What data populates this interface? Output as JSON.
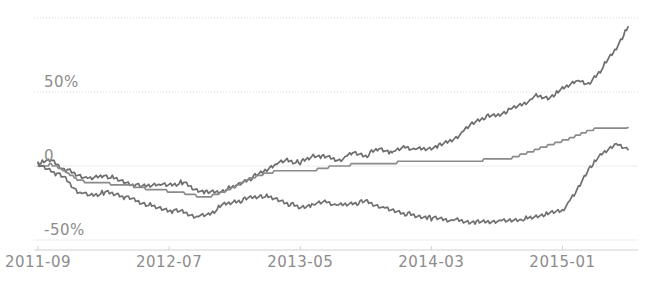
{
  "chart_data": {
    "type": "line",
    "title": "",
    "xlabel": "",
    "ylabel": "",
    "grid": true,
    "legend": "none",
    "xlim": [
      "2011-09",
      "2015-06"
    ],
    "ylim": [
      -62,
      105
    ],
    "ytick_labels": [
      "50%",
      "0",
      "-50%"
    ],
    "ytick_values": [
      50,
      0,
      -50
    ],
    "gridline_values": [
      100,
      50,
      0,
      -50
    ],
    "xtick_labels": [
      "2011-09",
      "2012-07",
      "2013-05",
      "2014-03",
      "2015-01"
    ],
    "x": [
      "2011-09",
      "2011-10",
      "2011-11",
      "2011-12",
      "2012-01",
      "2012-02",
      "2012-03",
      "2012-04",
      "2012-05",
      "2012-06",
      "2012-07",
      "2012-08",
      "2012-09",
      "2012-10",
      "2012-11",
      "2012-12",
      "2013-01",
      "2013-02",
      "2013-03",
      "2013-04",
      "2013-05",
      "2013-06",
      "2013-07",
      "2013-08",
      "2013-09",
      "2013-10",
      "2013-11",
      "2013-12",
      "2014-01",
      "2014-02",
      "2014-03",
      "2014-04",
      "2014-05",
      "2014-06",
      "2014-07",
      "2014-08",
      "2014-09",
      "2014-10",
      "2014-11",
      "2014-12",
      "2015-01",
      "2015-02",
      "2015-03",
      "2015-04",
      "2015-05",
      "2015-06"
    ],
    "series": [
      {
        "name": "series-1",
        "color": "#6d6d6d",
        "style": "noisy",
        "values": [
          2,
          4,
          -2,
          -6,
          -9,
          -6,
          -9,
          -12,
          -14,
          -12,
          -13,
          -11,
          -16,
          -18,
          -17,
          -14,
          -9,
          -5,
          1,
          4,
          2,
          7,
          6,
          4,
          9,
          7,
          12,
          9,
          13,
          11,
          12,
          15,
          20,
          28,
          33,
          34,
          38,
          42,
          47,
          46,
          52,
          58,
          55,
          66,
          78,
          94
        ]
      },
      {
        "name": "series-2",
        "color": "#8a8a8a",
        "style": "stepped",
        "values": [
          0,
          1,
          -3,
          -9,
          -12,
          -11,
          -13,
          -13,
          -15,
          -16,
          -17,
          -18,
          -20,
          -21,
          -18,
          -14,
          -9,
          -6,
          -4,
          -3,
          -4,
          -3,
          -1,
          0,
          1,
          1,
          2,
          2,
          3,
          3,
          3,
          3,
          3,
          3,
          4,
          4,
          5,
          8,
          11,
          14,
          17,
          20,
          24,
          26,
          26,
          26
        ]
      },
      {
        "name": "series-3",
        "color": "#707070",
        "style": "noisy",
        "values": [
          1,
          -3,
          -8,
          -17,
          -20,
          -18,
          -19,
          -22,
          -25,
          -28,
          -30,
          -31,
          -34,
          -33,
          -27,
          -24,
          -22,
          -20,
          -22,
          -25,
          -28,
          -26,
          -24,
          -27,
          -25,
          -24,
          -27,
          -30,
          -32,
          -34,
          -35,
          -36,
          -37,
          -38,
          -38,
          -37,
          -37,
          -36,
          -34,
          -32,
          -30,
          -18,
          -2,
          8,
          15,
          11
        ]
      }
    ]
  },
  "axis": {
    "y_labels": [
      {
        "text": "50%",
        "value": 50
      },
      {
        "text": "0",
        "value": 0
      },
      {
        "text": "-50%",
        "value": -50
      }
    ],
    "x_labels": [
      {
        "text": "2011-09",
        "index": 0
      },
      {
        "text": "2012-07",
        "index": 10
      },
      {
        "text": "2013-05",
        "index": 20
      },
      {
        "text": "2014-03",
        "index": 30
      },
      {
        "text": "2015-01",
        "index": 40
      }
    ]
  },
  "colors": {
    "background": "#ffffff",
    "gridline": "#d8d8d8",
    "axis_line": "#d0d0d0",
    "tick_text": "#8c8c8c",
    "series_dark": "#6d6d6d",
    "series_mid": "#8a8a8a",
    "series_light": "#707070"
  }
}
